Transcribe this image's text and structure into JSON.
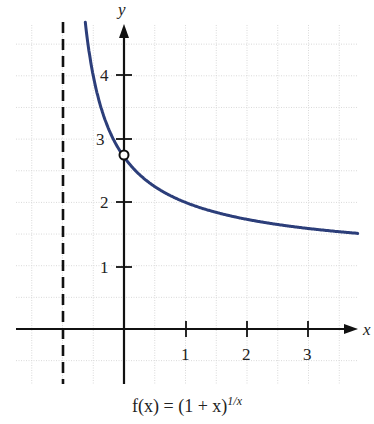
{
  "chart_data": {
    "type": "line",
    "xlabel": "x",
    "ylabel": "y",
    "x_ticks": [
      1,
      2,
      3
    ],
    "y_ticks": [
      1,
      2,
      3,
      4
    ],
    "xlim": [
      -1.75,
      3.75
    ],
    "ylim": [
      -0.9,
      4.9
    ],
    "grid": true,
    "grid_step": 0.5,
    "asymptote": {
      "type": "vertical",
      "x": -1,
      "style": "dashed"
    },
    "open_point": {
      "x": 0,
      "y": 2.718
    },
    "series": [
      {
        "name": "f(x) = (1 + x)^(1/x)",
        "color": "#2c3e7a",
        "points": [
          {
            "x": -0.62,
            "y": 12.7
          },
          {
            "x": -0.6,
            "y": 4.61
          },
          {
            "x": -0.5,
            "y": 4.0
          },
          {
            "x": -0.4,
            "y": 3.58
          },
          {
            "x": -0.3,
            "y": 3.28
          },
          {
            "x": -0.2,
            "y": 3.05
          },
          {
            "x": -0.1,
            "y": 2.87
          },
          {
            "x": 0,
            "y": 2.718
          },
          {
            "x": 0.25,
            "y": 2.44
          },
          {
            "x": 0.5,
            "y": 2.25
          },
          {
            "x": 1,
            "y": 2.0
          },
          {
            "x": 1.5,
            "y": 1.84
          },
          {
            "x": 2,
            "y": 1.73
          },
          {
            "x": 2.5,
            "y": 1.65
          },
          {
            "x": 3,
            "y": 1.59
          },
          {
            "x": 3.5,
            "y": 1.54
          },
          {
            "x": 3.8,
            "y": 1.52
          }
        ]
      }
    ]
  },
  "labels": {
    "x_axis": "x",
    "y_axis": "y",
    "x_ticks": [
      "1",
      "2",
      "3"
    ],
    "y_ticks": [
      "1",
      "2",
      "3",
      "4"
    ],
    "caption_prefix": "f(x) = (1 + x)",
    "caption_exponent": "1/x"
  },
  "colors": {
    "curve": "#2c3e7a",
    "axis": "#111111",
    "grid": "#d9d9d9"
  }
}
